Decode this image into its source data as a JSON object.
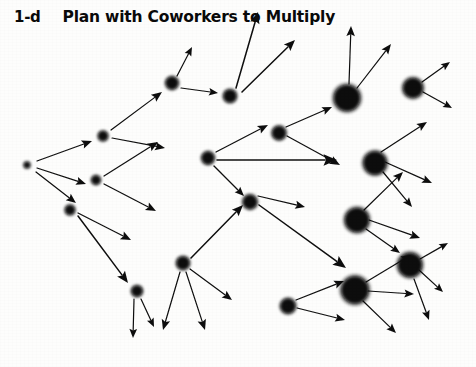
{
  "header": {
    "slide_number": "1-d",
    "title": "Plan with Coworkers to Multiply"
  },
  "diagram": {
    "ink_color": "#0d0d0d",
    "background_color": "#fdfdfc",
    "nodes": [
      {
        "id": "n0",
        "cx": 27,
        "cy": 165,
        "r": 3.2,
        "generation": 0
      },
      {
        "id": "n1",
        "cx": 103,
        "cy": 136,
        "r": 5.0,
        "generation": 1
      },
      {
        "id": "n2",
        "cx": 96,
        "cy": 180,
        "r": 4.6,
        "generation": 1
      },
      {
        "id": "n3",
        "cx": 70,
        "cy": 210,
        "r": 5.0,
        "generation": 1
      },
      {
        "id": "n4",
        "cx": 172,
        "cy": 83,
        "r": 6.4,
        "generation": 2
      },
      {
        "id": "n5",
        "cx": 230,
        "cy": 96,
        "r": 6.6,
        "generation": 2
      },
      {
        "id": "n6",
        "cx": 208,
        "cy": 158,
        "r": 6.4,
        "generation": 2
      },
      {
        "id": "n7",
        "cx": 183,
        "cy": 263,
        "r": 6.6,
        "generation": 2
      },
      {
        "id": "n8",
        "cx": 137,
        "cy": 291,
        "r": 5.6,
        "generation": 2
      },
      {
        "id": "n9",
        "cx": 279,
        "cy": 133,
        "r": 7.0,
        "generation": 3
      },
      {
        "id": "n10",
        "cx": 250,
        "cy": 202,
        "r": 7.2,
        "generation": 3
      },
      {
        "id": "n11",
        "cx": 288,
        "cy": 306,
        "r": 7.6,
        "generation": 3
      },
      {
        "id": "n12",
        "cx": 347,
        "cy": 98,
        "r": 13.0,
        "generation": 4
      },
      {
        "id": "n13",
        "cx": 375,
        "cy": 163,
        "r": 11.5,
        "generation": 4
      },
      {
        "id": "n14",
        "cx": 357,
        "cy": 220,
        "r": 12.0,
        "generation": 4
      },
      {
        "id": "n15",
        "cx": 355,
        "cy": 290,
        "r": 13.5,
        "generation": 4
      },
      {
        "id": "n16",
        "cx": 413,
        "cy": 88,
        "r": 10.0,
        "generation": 5
      },
      {
        "id": "n17",
        "cx": 410,
        "cy": 265,
        "r": 12.0,
        "generation": 5
      }
    ],
    "arrows": [
      {
        "x1": 37,
        "y1": 161,
        "x2": 92,
        "y2": 141
      },
      {
        "x1": 37,
        "y1": 168,
        "x2": 86,
        "y2": 184
      },
      {
        "x1": 36,
        "y1": 172,
        "x2": 76,
        "y2": 203
      },
      {
        "x1": 111,
        "y1": 130,
        "x2": 162,
        "y2": 92
      },
      {
        "x1": 112,
        "y1": 138,
        "x2": 165,
        "y2": 148
      },
      {
        "x1": 104,
        "y1": 176,
        "x2": 158,
        "y2": 142
      },
      {
        "x1": 104,
        "y1": 184,
        "x2": 156,
        "y2": 211
      },
      {
        "x1": 78,
        "y1": 213,
        "x2": 131,
        "y2": 240
      },
      {
        "x1": 78,
        "y1": 216,
        "x2": 128,
        "y2": 283
      },
      {
        "x1": 177,
        "y1": 76,
        "x2": 192,
        "y2": 47
      },
      {
        "x1": 181,
        "y1": 88,
        "x2": 218,
        "y2": 93
      },
      {
        "x1": 236,
        "y1": 88,
        "x2": 258,
        "y2": 12
      },
      {
        "x1": 242,
        "y1": 92,
        "x2": 295,
        "y2": 40
      },
      {
        "x1": 216,
        "y1": 152,
        "x2": 268,
        "y2": 125
      },
      {
        "x1": 217,
        "y1": 160,
        "x2": 337,
        "y2": 160
      },
      {
        "x1": 214,
        "y1": 166,
        "x2": 244,
        "y2": 196
      },
      {
        "x1": 191,
        "y1": 258,
        "x2": 243,
        "y2": 205
      },
      {
        "x1": 190,
        "y1": 269,
        "x2": 232,
        "y2": 300
      },
      {
        "x1": 186,
        "y1": 272,
        "x2": 205,
        "y2": 330
      },
      {
        "x1": 180,
        "y1": 272,
        "x2": 163,
        "y2": 330
      },
      {
        "x1": 141,
        "y1": 299,
        "x2": 154,
        "y2": 327
      },
      {
        "x1": 134,
        "y1": 299,
        "x2": 133,
        "y2": 338
      },
      {
        "x1": 286,
        "y1": 127,
        "x2": 332,
        "y2": 107
      },
      {
        "x1": 287,
        "y1": 136,
        "x2": 340,
        "y2": 165
      },
      {
        "x1": 258,
        "y1": 196,
        "x2": 305,
        "y2": 207
      },
      {
        "x1": 259,
        "y1": 205,
        "x2": 346,
        "y2": 268
      },
      {
        "x1": 296,
        "y1": 300,
        "x2": 344,
        "y2": 281
      },
      {
        "x1": 297,
        "y1": 308,
        "x2": 345,
        "y2": 320
      },
      {
        "x1": 349,
        "y1": 84,
        "x2": 351,
        "y2": 26
      },
      {
        "x1": 357,
        "y1": 88,
        "x2": 391,
        "y2": 44
      },
      {
        "x1": 381,
        "y1": 152,
        "x2": 427,
        "y2": 122
      },
      {
        "x1": 385,
        "y1": 162,
        "x2": 432,
        "y2": 183
      },
      {
        "x1": 383,
        "y1": 172,
        "x2": 412,
        "y2": 207
      },
      {
        "x1": 364,
        "y1": 210,
        "x2": 403,
        "y2": 172
      },
      {
        "x1": 369,
        "y1": 220,
        "x2": 420,
        "y2": 238
      },
      {
        "x1": 366,
        "y1": 229,
        "x2": 400,
        "y2": 253
      },
      {
        "x1": 366,
        "y1": 282,
        "x2": 411,
        "y2": 255
      },
      {
        "x1": 368,
        "y1": 291,
        "x2": 414,
        "y2": 294
      },
      {
        "x1": 363,
        "y1": 301,
        "x2": 396,
        "y2": 333
      },
      {
        "x1": 422,
        "y1": 82,
        "x2": 450,
        "y2": 62
      },
      {
        "x1": 423,
        "y1": 92,
        "x2": 452,
        "y2": 108
      },
      {
        "x1": 420,
        "y1": 259,
        "x2": 448,
        "y2": 243
      },
      {
        "x1": 419,
        "y1": 270,
        "x2": 443,
        "y2": 292
      },
      {
        "x1": 414,
        "y1": 279,
        "x2": 429,
        "y2": 320
      }
    ]
  }
}
